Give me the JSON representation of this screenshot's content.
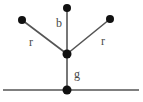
{
  "canvas": {
    "width": 143,
    "height": 102,
    "background_color": "#ffffff"
  },
  "diagram": {
    "title": "",
    "type": "node-link-graph",
    "stroke_color": "#555555",
    "node_color": "#111111",
    "label_color": "#4a4a4a",
    "node_radius": 4,
    "edge_width": 1.6,
    "baseline_width": 1.6,
    "nodes": [
      {
        "id": "top",
        "name": "top-node",
        "x": 67,
        "y": 8,
        "r": 4
      },
      {
        "id": "left",
        "name": "upper-left-node",
        "x": 22,
        "y": 20,
        "r": 4
      },
      {
        "id": "right",
        "name": "upper-right-node",
        "x": 110,
        "y": 19,
        "r": 4
      },
      {
        "id": "center",
        "name": "center-junction-node",
        "x": 67,
        "y": 54,
        "r": 4.5
      },
      {
        "id": "bottom",
        "name": "bottom-node",
        "x": 67,
        "y": 90,
        "r": 4.5
      }
    ],
    "edges": [
      {
        "id": "e-center-top",
        "name": "edge-center-to-top",
        "from": "center",
        "to": "top",
        "label": "b"
      },
      {
        "id": "e-center-left",
        "name": "edge-center-to-left",
        "from": "center",
        "to": "left",
        "label": "r"
      },
      {
        "id": "e-center-right",
        "name": "edge-center-to-right",
        "from": "center",
        "to": "right",
        "label": "r"
      },
      {
        "id": "e-center-bottom",
        "name": "edge-center-to-bottom",
        "from": "center",
        "to": "bottom",
        "label": "g"
      }
    ],
    "labels": {
      "b": "b",
      "r_left": "r",
      "r_right": "r",
      "g": "g"
    },
    "label_positions": {
      "b": {
        "x": 59,
        "y": 27
      },
      "r_left": {
        "x": 31,
        "y": 46
      },
      "r_right": {
        "x": 103,
        "y": 45
      },
      "g": {
        "x": 77,
        "y": 78
      }
    },
    "baseline": {
      "name": "ground-line",
      "x1": 3,
      "y1": 90,
      "x2": 139,
      "y2": 90
    }
  }
}
